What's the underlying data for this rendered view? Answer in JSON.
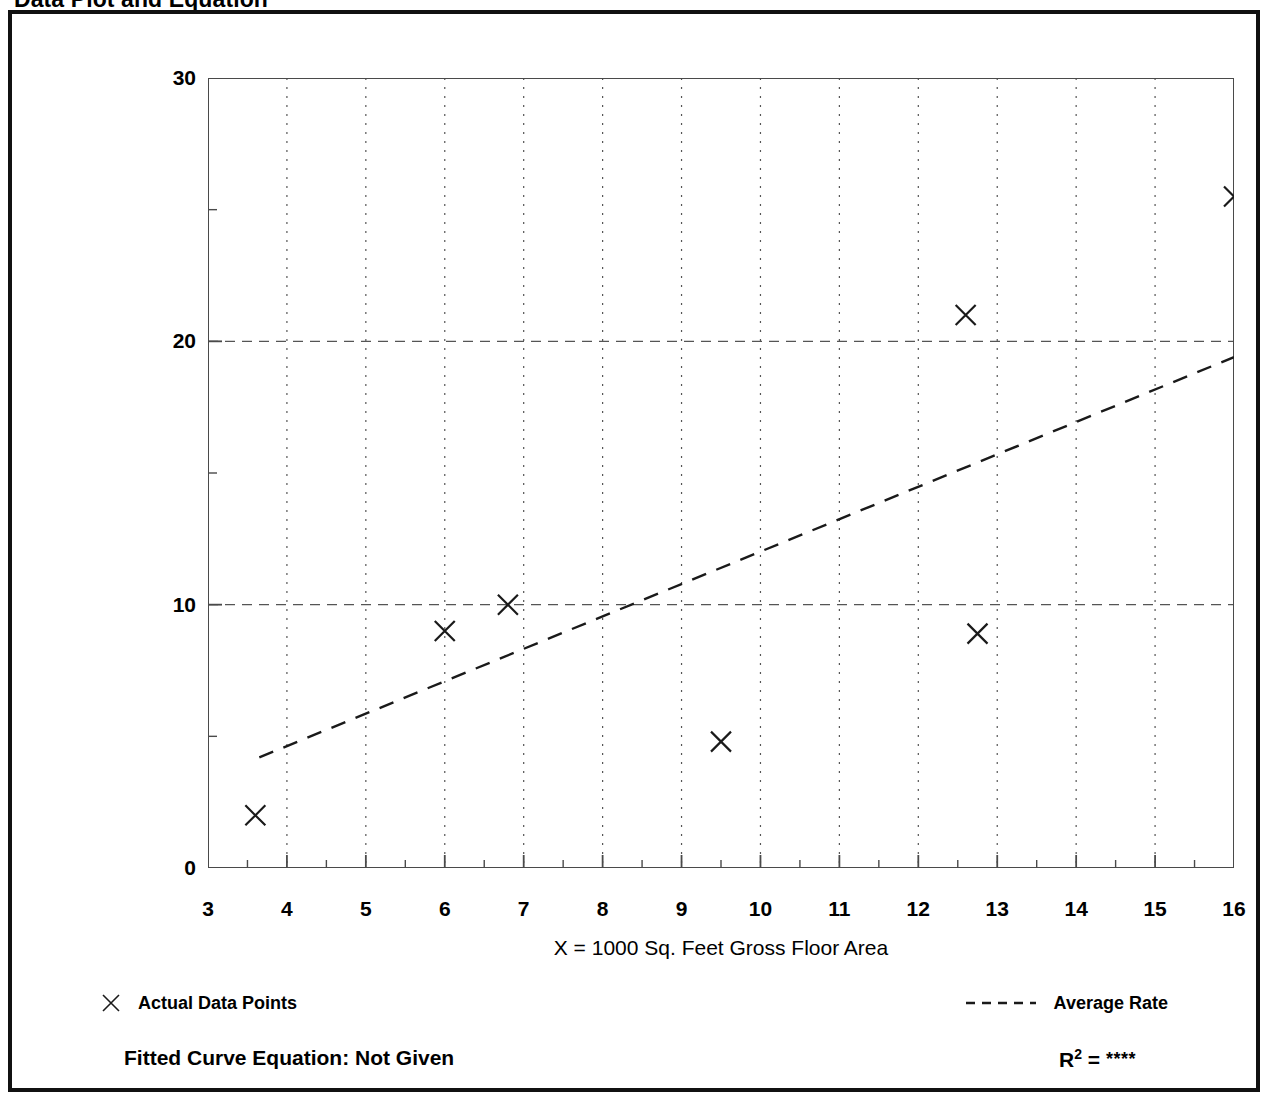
{
  "title": "Data Plot and Equation",
  "chart_data": {
    "type": "scatter",
    "title": "Data Plot and Equation",
    "xlabel": "X = 1000 Sq. Feet Gross Floor Area",
    "ylabel": "T = Average Vehicle Trip Ends",
    "xlim": [
      3,
      16
    ],
    "ylim": [
      0,
      30
    ],
    "x_ticks": [
      3,
      4,
      5,
      6,
      7,
      8,
      9,
      10,
      11,
      12,
      13,
      14,
      15,
      16
    ],
    "x_tick_labels": [
      "3",
      "4",
      "5",
      "6",
      "7",
      "8",
      "9",
      "10",
      "11",
      "12",
      "13",
      "14",
      "15",
      "16"
    ],
    "x_minor_tick_step": 0.5,
    "y_ticks": [
      0,
      10,
      20,
      30
    ],
    "y_tick_labels": [
      "0",
      "10",
      "20",
      "30"
    ],
    "y_minor_ticks": [
      5,
      15,
      25
    ],
    "grid": {
      "vertical_dotted_at": [
        4,
        5,
        6,
        7,
        8,
        9,
        10,
        11,
        12,
        13,
        14,
        15
      ],
      "horizontal_dashed_at": [
        10,
        20
      ]
    },
    "legend_position": "below-plot",
    "series": [
      {
        "name": "Actual Data Points",
        "type": "scatter",
        "marker": "x",
        "color": "#1a1a1a",
        "points": [
          {
            "x": 3.6,
            "y": 2.0
          },
          {
            "x": 6.0,
            "y": 9.0
          },
          {
            "x": 6.8,
            "y": 10.0
          },
          {
            "x": 9.5,
            "y": 4.8
          },
          {
            "x": 12.6,
            "y": 21.0
          },
          {
            "x": 12.75,
            "y": 8.9
          },
          {
            "x": 16.0,
            "y": 25.5
          }
        ]
      },
      {
        "name": "Average Rate",
        "type": "line",
        "linestyle": "dashed",
        "color": "#1a1a1a",
        "endpoints": [
          {
            "x": 3.65,
            "y": 4.2
          },
          {
            "x": 16.0,
            "y": 19.4
          }
        ]
      }
    ]
  },
  "legend": {
    "data_points_label": "Actual Data Points",
    "data_points_marker_icon": "x-marker-icon",
    "average_rate_label": "Average Rate",
    "average_rate_marker_icon": "dashed-line-icon"
  },
  "footer": {
    "fitted_curve_equation": "Fitted Curve Equation:  Not Given",
    "r_squared_symbol": "R",
    "r_squared_exponent": "2",
    "r_squared_equals": " = ",
    "r_squared_value": "****"
  },
  "colors": {
    "frame": "#111111",
    "axis": "#4a4a4a",
    "marker": "#1a1a1a",
    "grid": "#555555",
    "background": "#ffffff"
  }
}
